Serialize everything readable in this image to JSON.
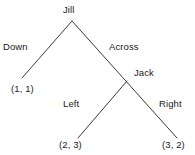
{
  "diagram": {
    "type": "game-tree",
    "title": "",
    "nodes": [
      {
        "id": "jill",
        "label": "Jill",
        "x": 72,
        "y": 21,
        "role": "root-player"
      },
      {
        "id": "jack",
        "label": "Jack",
        "x": 127,
        "y": 81,
        "role": "player"
      }
    ],
    "edges": [
      {
        "id": "down",
        "label": "Down",
        "from": "jill",
        "to": "payoff-a"
      },
      {
        "id": "across",
        "label": "Across",
        "from": "jill",
        "to": "jack"
      },
      {
        "id": "left",
        "label": "Left",
        "from": "jack",
        "to": "payoff-b"
      },
      {
        "id": "right",
        "label": "Right",
        "from": "jack",
        "to": "payoff-c"
      }
    ],
    "payoffs": [
      {
        "id": "payoff-a",
        "label": "(1, 1)",
        "x": 22,
        "y": 78
      },
      {
        "id": "payoff-b",
        "label": "(2, 3)",
        "x": 78,
        "y": 138
      },
      {
        "id": "payoff-c",
        "label": "(3, 2)",
        "x": 177,
        "y": 138
      }
    ],
    "colors": {
      "line": "#3a3a3a",
      "text": "#1a1a1a",
      "background": "#ffffff"
    }
  }
}
